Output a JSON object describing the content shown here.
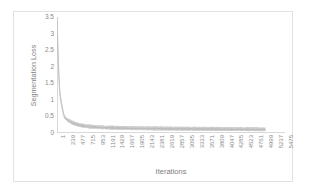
{
  "chart_data": {
    "type": "line",
    "title": "",
    "xlabel": "Iterations",
    "ylabel": "Segmentation  Loss",
    "ylim": [
      0,
      3.5
    ],
    "xlim": [
      1,
      5475
    ],
    "grid": false,
    "legend": null,
    "series_color": "#c9c9c9",
    "axis_color": "#d9d9d9",
    "text_color": "#8a8a8a",
    "frame_color": "#e2e2e2",
    "y_ticks": [
      "3.5",
      "3",
      "2.5",
      "2",
      "1.5",
      "1",
      "0.5",
      "0"
    ],
    "y_tick_values": [
      3.5,
      3,
      2.5,
      2,
      1.5,
      1,
      0.5,
      0
    ],
    "x_ticks": [
      "1",
      "239",
      "477",
      "715",
      "953",
      "1191",
      "1429",
      "1667",
      "1905",
      "2143",
      "2381",
      "2619",
      "2857",
      "3095",
      "3333",
      "3571",
      "3809",
      "4047",
      "4285",
      "4523",
      "4761",
      "4999",
      "5237",
      "5475"
    ],
    "x_tick_values": [
      1,
      239,
      477,
      715,
      953,
      1191,
      1429,
      1667,
      1905,
      2143,
      2381,
      2619,
      2857,
      3095,
      3333,
      3571,
      3809,
      4047,
      4285,
      4523,
      4761,
      4999,
      5237,
      5475
    ],
    "series": [
      {
        "name": "Segmentation Loss",
        "x": [
          1,
          20,
          40,
          60,
          80,
          100,
          120,
          140,
          160,
          180,
          200,
          239,
          280,
          320,
          360,
          400,
          440,
          477,
          520,
          560,
          600,
          650,
          715,
          780,
          840,
          900,
          953,
          1020,
          1080,
          1140,
          1191,
          1260,
          1320,
          1380,
          1429,
          1500,
          1560,
          1620,
          1667,
          1740,
          1800,
          1860,
          1905,
          1980,
          2040,
          2100,
          2143,
          2220,
          2280,
          2340,
          2381,
          2460,
          2520,
          2580,
          2619,
          2700,
          2760,
          2820,
          2857,
          2940,
          3000,
          3060,
          3095,
          3180,
          3240,
          3300,
          3333,
          3420,
          3480,
          3540,
          3571,
          3660,
          3720,
          3780,
          3809,
          3900,
          3960,
          4020,
          4047,
          4140,
          4200,
          4260,
          4285,
          4380,
          4440,
          4500,
          4523,
          4620,
          4680,
          4740,
          4761,
          4860,
          4920,
          4980,
          4999
        ],
        "y": [
          3.25,
          2.55,
          1.85,
          1.35,
          1.05,
          0.92,
          0.78,
          0.66,
          0.55,
          0.48,
          0.44,
          0.4,
          0.36,
          0.33,
          0.3,
          0.28,
          0.26,
          0.25,
          0.23,
          0.22,
          0.21,
          0.2,
          0.19,
          0.18,
          0.175,
          0.17,
          0.165,
          0.16,
          0.155,
          0.152,
          0.15,
          0.148,
          0.145,
          0.143,
          0.14,
          0.138,
          0.137,
          0.135,
          0.134,
          0.132,
          0.131,
          0.13,
          0.129,
          0.128,
          0.127,
          0.126,
          0.125,
          0.124,
          0.123,
          0.122,
          0.122,
          0.121,
          0.12,
          0.12,
          0.119,
          0.118,
          0.118,
          0.117,
          0.117,
          0.116,
          0.115,
          0.115,
          0.114,
          0.113,
          0.113,
          0.112,
          0.112,
          0.111,
          0.11,
          0.11,
          0.109,
          0.108,
          0.108,
          0.107,
          0.107,
          0.106,
          0.105,
          0.105,
          0.104,
          0.103,
          0.103,
          0.102,
          0.102,
          0.101,
          0.1,
          0.1,
          0.1,
          0.099,
          0.098,
          0.098,
          0.097,
          0.096,
          0.095,
          0.095,
          0.094
        ],
        "noise_band": 0.055,
        "x_end": 4999
      }
    ]
  }
}
